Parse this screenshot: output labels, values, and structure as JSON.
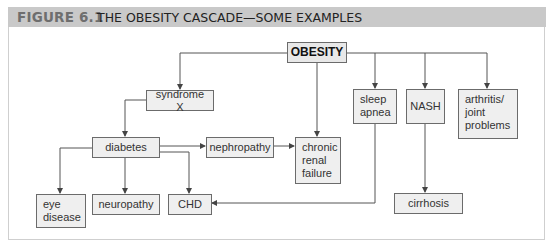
{
  "figure": {
    "number": "FIGURE 6.1",
    "title": "THE OBESITY CASCADE—SOME EXAMPLES"
  },
  "nodes": {
    "obesity": "OBESITY",
    "syndrome_x": "syndrome X",
    "diabetes": "diabetes",
    "nephropathy": "nephropathy",
    "chronic_renal_failure": "chronic renal failure",
    "sleep_apnea": "sleep apnea",
    "nash": "NASH",
    "arthritis": "arthritis/ joint problems",
    "eye_disease": "eye disease",
    "neuropathy": "neuropathy",
    "chd": "CHD",
    "cirrhosis": "cirrhosis"
  },
  "edges": [
    [
      "OBESITY",
      "syndrome X"
    ],
    [
      "OBESITY",
      "chronic renal failure"
    ],
    [
      "OBESITY",
      "sleep apnea"
    ],
    [
      "OBESITY",
      "NASH"
    ],
    [
      "OBESITY",
      "arthritis/ joint problems"
    ],
    [
      "syndrome X",
      "diabetes"
    ],
    [
      "diabetes",
      "nephropathy"
    ],
    [
      "diabetes",
      "eye disease"
    ],
    [
      "diabetes",
      "neuropathy"
    ],
    [
      "diabetes",
      "CHD"
    ],
    [
      "nephropathy",
      "chronic renal failure"
    ],
    [
      "sleep apnea",
      "CHD"
    ],
    [
      "NASH",
      "cirrhosis"
    ]
  ],
  "colors": {
    "header_bg": "#c9c9c9",
    "node_fill": "#efefef",
    "node_border": "#6b6b6b",
    "line": "#555555"
  }
}
